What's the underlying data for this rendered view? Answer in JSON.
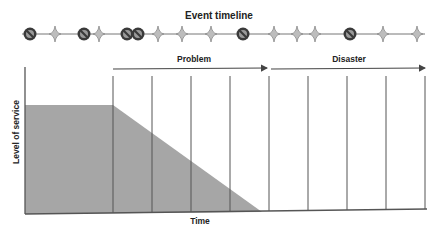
{
  "timeline": {
    "title": "Event timeline",
    "line": {
      "x1": 22,
      "x2": 425,
      "y": 34
    },
    "events": [
      {
        "type": "prohibition",
        "x": 30
      },
      {
        "type": "star",
        "x": 55
      },
      {
        "type": "prohibition",
        "x": 84
      },
      {
        "type": "star",
        "x": 99
      },
      {
        "type": "prohibition",
        "x": 127
      },
      {
        "type": "prohibition",
        "x": 138
      },
      {
        "type": "star",
        "x": 158
      },
      {
        "type": "star",
        "x": 182
      },
      {
        "type": "star",
        "x": 211
      },
      {
        "type": "prohibition",
        "x": 243
      },
      {
        "type": "star",
        "x": 274
      },
      {
        "type": "star",
        "x": 297
      },
      {
        "type": "star",
        "x": 315
      },
      {
        "type": "prohibition",
        "x": 350
      },
      {
        "type": "star",
        "x": 383
      },
      {
        "type": "star",
        "x": 417
      }
    ]
  },
  "phases": [
    {
      "label": "Problem",
      "x1": 113,
      "x2": 267,
      "label_x": 194
    },
    {
      "label": "Disaster",
      "x1": 271,
      "x2": 425,
      "label_x": 349
    }
  ],
  "axes": {
    "y_label": "Level of service",
    "x_label": "Time"
  },
  "gridlines_x": [
    113,
    152,
    191,
    230,
    269,
    308,
    347,
    386,
    425
  ],
  "service_area": {
    "color": "#a6a6a6",
    "level_top_y": 105,
    "decline_start_x": 113,
    "decline_end_x": 262
  },
  "colors": {
    "line": "#555555",
    "icon_fill": "#3a3a3a",
    "star": "#8a8a8a"
  }
}
